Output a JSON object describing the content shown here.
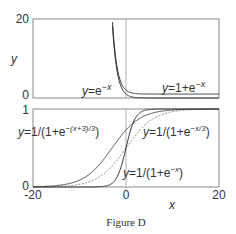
{
  "caption": "Figure D",
  "chart_data": [
    {
      "type": "line",
      "panel": "top",
      "xlim": [
        -20,
        20
      ],
      "ylim": [
        0,
        20
      ],
      "ylabel": "y",
      "xlabel": "",
      "yticks": [
        "0",
        "20"
      ],
      "xticks": [],
      "series": [
        {
          "name": "y=e^-x",
          "label_prefix": "y",
          "label_text": "=e",
          "label_sup": "−x",
          "formula": "exp",
          "color": "#333333"
        },
        {
          "name": "y=1+e^-x",
          "label_prefix": "y",
          "label_text": "=1+e",
          "label_sup": "−x",
          "formula": "oneplusexp",
          "color": "#333333"
        }
      ],
      "vline_x": 0
    },
    {
      "type": "line",
      "panel": "bottom",
      "xlim": [
        -20,
        20
      ],
      "ylim": [
        0,
        1
      ],
      "xlabel": "x",
      "ylabel": "",
      "yticks": [
        "0",
        "1"
      ],
      "xticks": [
        "-20",
        "0",
        "20"
      ],
      "series": [
        {
          "name": "y=1/(1+e^-x)",
          "label_prefix": "y",
          "label_text": "=1/(1+e",
          "label_sup": "−x",
          "label_suffix": ")",
          "k": 1,
          "shift": 0,
          "style": "solid",
          "color": "#333333"
        },
        {
          "name": "y=1/(1+e^-(x+3)/3)",
          "label_prefix": "y",
          "label_text": "=1/(1+e",
          "label_sup": "−(x+3)/3",
          "label_suffix": ")",
          "k": 0.3333,
          "shift": 3,
          "style": "solid",
          "color": "#444444"
        },
        {
          "name": "y=1/(1+e^-x/3)",
          "label_prefix": "y",
          "label_text": "=1/(1+e",
          "label_sup": "−x/3",
          "label_suffix": ")",
          "k": 0.3333,
          "shift": 0,
          "style": "dashed",
          "color": "#777777"
        }
      ],
      "vline_x": 0
    }
  ]
}
